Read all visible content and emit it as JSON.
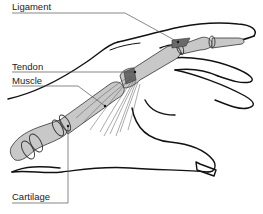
{
  "diagram": {
    "labels": [
      {
        "id": "ligament",
        "text": "Ligament",
        "x": 12,
        "y": 2
      },
      {
        "id": "tendon",
        "text": "Tendon",
        "x": 12,
        "y": 62
      },
      {
        "id": "muscle",
        "text": "Muscle",
        "x": 12,
        "y": 76
      },
      {
        "id": "cartilage",
        "text": "Cartilage",
        "x": 12,
        "y": 192
      }
    ],
    "colors": {
      "outline": "#111111",
      "bone": "#c8c8c8",
      "bone_dark": "#6a6a6a",
      "leader": "#555555",
      "text": "#222222",
      "background": "#ffffff"
    }
  }
}
